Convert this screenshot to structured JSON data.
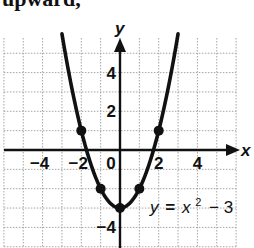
{
  "top_text": "upward,",
  "chart_data": {
    "type": "line",
    "title": "",
    "function": "y = x^2 - 3",
    "equation_label": {
      "lhs": "y",
      "eq": "=",
      "x": "x",
      "exp": "2",
      "rest": "− 3"
    },
    "xlabel": "x",
    "ylabel": "y",
    "xlim": [
      -6,
      6
    ],
    "ylim": [
      -5,
      6
    ],
    "grid": true,
    "x_ticks": [
      {
        "value": -4,
        "label": "−4"
      },
      {
        "value": -2,
        "label": "−2"
      },
      {
        "value": 0,
        "label": "0"
      },
      {
        "value": 2,
        "label": "2"
      },
      {
        "value": 4,
        "label": "4"
      }
    ],
    "y_ticks": [
      {
        "value": 4,
        "label": "4"
      },
      {
        "value": 2,
        "label": "2"
      },
      {
        "value": -4,
        "label": "−4"
      }
    ],
    "points": [
      {
        "x": -2,
        "y": 1
      },
      {
        "x": -1,
        "y": -2
      },
      {
        "x": 0,
        "y": -3
      },
      {
        "x": 1,
        "y": -2
      },
      {
        "x": 2,
        "y": 1
      }
    ],
    "curve_x_range": [
      -3,
      3
    ],
    "colors": {
      "curve": "#111111",
      "grid": "#9a9a9a",
      "axis": "#111111"
    }
  }
}
